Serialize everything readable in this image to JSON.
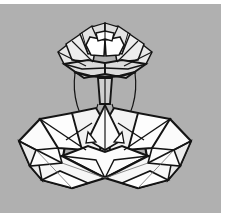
{
  "artwork": {
    "title": "Origami Lotus Flower Crest",
    "subject": "folded-paper lotus on a stem, bilaterally symmetric",
    "medium": "black ink line drawing",
    "style": "low-poly origami crease pattern",
    "width_px": 229,
    "height_px": 224
  },
  "canvas": {
    "background_color": "#b0b0b0",
    "paper_color": "#ffffff",
    "margin_right_px": 8,
    "margin_bottom_px": 11,
    "margin_top_px": 4
  },
  "ink": {
    "stroke_color": "#141414",
    "stroke_color_soft": "#4a4a4a",
    "facet_fill_light": "#fbfbfb",
    "facet_fill_mid": "#efefef",
    "facet_fill_shadow": "#d8d8d8",
    "stroke_width_major": 2.2,
    "stroke_width_minor": 1.1,
    "stroke_width_hair": 0.8
  },
  "composition": {
    "axis_of_symmetry_x": 105,
    "upper_blossom_label": "upper blossom",
    "upper_blossom_bounds": {
      "x": 58,
      "y": 22,
      "w": 96,
      "h": 62
    },
    "stem_label": "stem",
    "stem_bounds": {
      "x": 96,
      "y": 78,
      "w": 18,
      "h": 48
    },
    "lower_blossom_label": "lower blossom",
    "lower_blossom_bounds": {
      "x": 18,
      "y": 104,
      "w": 176,
      "h": 84
    }
  },
  "notes": {
    "facet_count_label": "facets",
    "facet_count": 46,
    "symmetry_label": "symmetry",
    "symmetry_value": "bilateral (vertical)"
  }
}
